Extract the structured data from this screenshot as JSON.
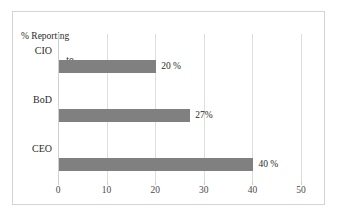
{
  "chart_data": {
    "type": "bar",
    "orientation": "horizontal",
    "title": "% Reporting to",
    "title_line_1": "% Reporting",
    "title_line_2": "to",
    "categories": [
      "CIO",
      "BoD",
      "CEO"
    ],
    "values": [
      20,
      27,
      40
    ],
    "data_labels": [
      "20 %",
      "27%",
      "40 %"
    ],
    "xlabel": "",
    "ylabel": "",
    "xlim": [
      0,
      50
    ],
    "xticks": [
      0,
      10,
      20,
      30,
      40,
      50
    ],
    "xtick_labels": [
      "0",
      "10",
      "20",
      "30",
      "40",
      "50"
    ],
    "grid": true,
    "legend": false,
    "series": [
      {
        "name": "% Reporting to",
        "values": [
          20,
          27,
          40
        ]
      }
    ],
    "bar_color": "#808080",
    "grid_color": "#dedede",
    "frame_color": "#d4d4d4",
    "text_color": "#2b2b2b"
  }
}
